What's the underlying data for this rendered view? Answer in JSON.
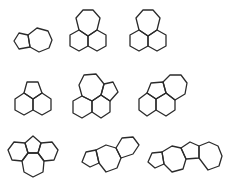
{
  "diagram": {
    "title": "",
    "stroke_color": "#2b2b2b",
    "background": "#ffffff",
    "molecules": [
      {
        "id": "m1",
        "description": "pentagon fused to heptagon (azulene skeleton)",
        "rings": [
          {
            "type": "pentagon",
            "points": "14,41 19,33 28,35 30,47 19,49"
          },
          {
            "type": "heptagon",
            "points": "28,35 37,28 48,31 52,40 49,48 39,52 30,47"
          }
        ]
      },
      {
        "id": "m2",
        "description": "heptagon on top of two fused hexagons",
        "rings": [
          {
            "type": "heptagon",
            "points": "79,30 76,18 83,10 93,10 100,18 97,30 88,36"
          },
          {
            "type": "hexagon",
            "points": "79,30 88,36 88,46 79,51 70,46 70,35"
          },
          {
            "type": "hexagon",
            "points": "88,36 97,30 106,35 106,46 97,51 88,46"
          }
        ]
      },
      {
        "id": "m3",
        "description": "heptagon on top of two fused hexagons",
        "rings": [
          {
            "type": "heptagon",
            "points": "139,30 136,18 143,10 153,10 160,18 157,30 148,36"
          },
          {
            "type": "hexagon",
            "points": "139,30 148,36 148,46 139,51 130,46 130,35"
          },
          {
            "type": "hexagon",
            "points": "148,36 157,30 166,35 166,46 157,51 148,46"
          }
        ]
      },
      {
        "id": "m4",
        "description": "pentagon on top of two fused hexagons (acenaphthene skeleton)",
        "rings": [
          {
            "type": "pentagon",
            "points": "24,93 27,82 38,82 42,93 33,99"
          },
          {
            "type": "hexagon",
            "points": "24,93 33,99 33,110 24,115 15,110 15,99"
          },
          {
            "type": "hexagon",
            "points": "33,99 42,93 51,99 51,110 42,115 33,110"
          }
        ]
      },
      {
        "id": "m5",
        "description": "heptagon and pentagon fused over two hexagons",
        "rings": [
          {
            "type": "heptagon",
            "points": "82,96 79,85 84,75 96,74 104,84 101,95 92,101"
          },
          {
            "type": "pentagon",
            "points": "101,95 104,84 113,82 118,92 110,101"
          },
          {
            "type": "hexagon",
            "points": "82,96 92,101 92,112 82,118 73,113 73,101"
          },
          {
            "type": "hexagon",
            "points": "92,101 101,95 110,101 110,112 101,118 92,112"
          }
        ]
      },
      {
        "id": "m6",
        "description": "pentagon and heptagon fused over two hexagons",
        "rings": [
          {
            "type": "pentagon",
            "points": "147,93 151,83 163,82 166,93 156,99"
          },
          {
            "type": "heptagon",
            "points": "166,93 163,82 170,75 181,75 187,83 185,94 175,100"
          },
          {
            "type": "hexagon",
            "points": "147,93 156,99 156,110 147,116 139,110 139,99"
          },
          {
            "type": "hexagon",
            "points": "156,99 166,93 175,100 175,110 166,116 156,110"
          }
        ]
      },
      {
        "id": "m7",
        "description": "central pentagon flanked by two hexagons with heptagon below",
        "rings": [
          {
            "type": "pentagon",
            "points": "25,143 33,136 41,143 38,153 28,153"
          },
          {
            "type": "hexagon",
            "points": "25,143 28,153 22,161 12,160 8,150 14,142"
          },
          {
            "type": "hexagon",
            "points": "41,143 38,153 44,161 54,160 58,150 52,142"
          },
          {
            "type": "heptagon",
            "points": "28,153 38,153 44,161 43,172 33,177 24,172 22,161"
          }
        ]
      },
      {
        "id": "m8",
        "description": "pentagon fused to heptagon fused to hexagon (linear)",
        "rings": [
          {
            "type": "pentagon",
            "points": "82,162 86,152 96,150 99,163 90,167"
          },
          {
            "type": "heptagon",
            "points": "96,150 106,145 116,148 121,158 117,168 106,172 99,163"
          },
          {
            "type": "hexagon",
            "points": "116,148 122,138 133,137 139,145 133,154 121,158"
          }
        ]
      },
      {
        "id": "m9",
        "description": "pentagon-heptagon-pentagon-heptagon linear fused chain",
        "rings": [
          {
            "type": "pentagon",
            "points": "148,162 152,153 162,152 164,164 155,168"
          },
          {
            "type": "heptagon",
            "points": "162,152 172,146 181,148 186,159 183,169 172,172 164,164"
          },
          {
            "type": "pentagon",
            "points": "181,148 190,142 199,146 199,158 186,159"
          },
          {
            "type": "heptagon",
            "points": "199,146 209,142 218,146 222,156 219,166 208,170 199,158"
          }
        ]
      }
    ]
  }
}
